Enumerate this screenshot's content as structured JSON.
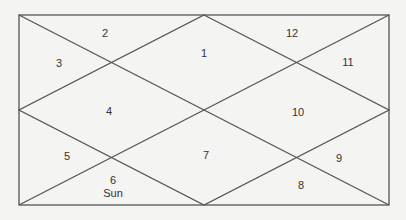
{
  "chart": {
    "type": "north-indian-birth-chart",
    "line_color": "#555555",
    "background": "#f4f4f2",
    "houses": [
      {
        "number": "1",
        "planets": ""
      },
      {
        "number": "2",
        "planets": ""
      },
      {
        "number": "3",
        "planets": ""
      },
      {
        "number": "4",
        "planets": ""
      },
      {
        "number": "5",
        "planets": ""
      },
      {
        "number": "6",
        "planets": "Sun"
      },
      {
        "number": "7",
        "planets": ""
      },
      {
        "number": "8",
        "planets": ""
      },
      {
        "number": "9",
        "planets": ""
      },
      {
        "number": "10",
        "planets": ""
      },
      {
        "number": "11",
        "planets": ""
      },
      {
        "number": "12",
        "planets": ""
      }
    ]
  }
}
